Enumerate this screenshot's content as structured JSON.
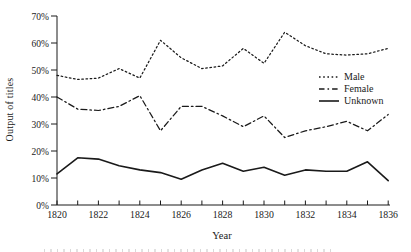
{
  "figure": {
    "y_axis_label": "Output of titles",
    "x_axis_label": "Year"
  },
  "chart_data": {
    "type": "line",
    "title": "",
    "xlabel": "Year",
    "ylabel": "Output of titles",
    "xlim": [
      1820,
      1836
    ],
    "ylim": [
      0,
      70
    ],
    "grid": false,
    "legend_position": "center-right",
    "line_color": "#1a1a1a",
    "x": [
      1820,
      1821,
      1822,
      1823,
      1824,
      1825,
      1826,
      1827,
      1828,
      1829,
      1830,
      1831,
      1832,
      1833,
      1834,
      1835,
      1836
    ],
    "x_tick_labels": [
      "1820",
      "1822",
      "1824",
      "1826",
      "1828",
      "1830",
      "1832",
      "1834",
      "1836"
    ],
    "y_tick_labels": [
      "0%",
      "10%",
      "20%",
      "30%",
      "40%",
      "50%",
      "60%",
      "70%"
    ],
    "series": [
      {
        "name": "Male",
        "style": "dotted",
        "values": [
          48,
          46.5,
          47,
          50.5,
          47,
          61,
          54.5,
          50.5,
          51.5,
          58,
          52.5,
          64,
          59,
          56,
          55.5,
          56,
          58
        ]
      },
      {
        "name": "Female",
        "style": "dash-dot",
        "values": [
          40,
          35.5,
          35,
          36.5,
          40.5,
          27.5,
          36.5,
          36.5,
          33,
          29,
          33,
          25,
          27.5,
          29,
          31,
          27.5,
          33.5
        ]
      },
      {
        "name": "Unknown",
        "style": "solid",
        "values": [
          11.5,
          17.5,
          17,
          14.5,
          13,
          12,
          9.5,
          13,
          15.5,
          12.5,
          14,
          11,
          13,
          12.5,
          12.5,
          16,
          9
        ]
      }
    ]
  }
}
